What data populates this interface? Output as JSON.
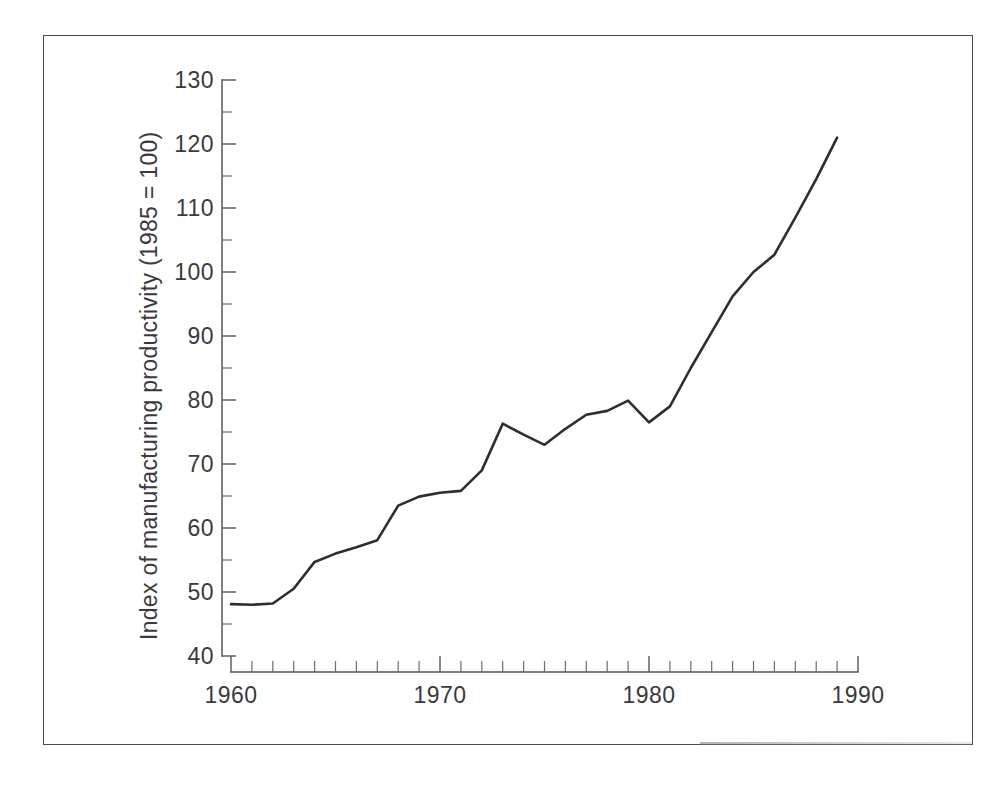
{
  "chart_data": {
    "type": "line",
    "title": "",
    "subtitle": "",
    "xlabel": "",
    "ylabel": "Index of manufacturing productivity (1985 = 100)",
    "ylim": [
      40,
      130
    ],
    "xlim": [
      1960,
      1990
    ],
    "y_ticks": [
      40,
      50,
      60,
      70,
      80,
      90,
      100,
      110,
      120,
      130
    ],
    "y_tick_labels": [
      "40",
      "50",
      "60",
      "70",
      "80",
      "90",
      "100",
      "110",
      "120",
      "130"
    ],
    "y_minor_tick_step": 5,
    "x_ticks": [
      1960,
      1970,
      1980,
      1990
    ],
    "x_tick_labels": [
      "1960",
      "1970",
      "1980",
      "1990"
    ],
    "x_minor_tick_step": 1,
    "grid": false,
    "legend": false,
    "legend_position": "none",
    "line_color": "#2e2e32",
    "x": [
      1960,
      1961,
      1962,
      1963,
      1964,
      1965,
      1966,
      1967,
      1968,
      1969,
      1970,
      1971,
      1972,
      1973,
      1974,
      1975,
      1976,
      1977,
      1978,
      1979,
      1980,
      1981,
      1982,
      1983,
      1984,
      1985,
      1986,
      1987,
      1988,
      1989
    ],
    "values": [
      48.1,
      48.0,
      48.2,
      50.5,
      54.7,
      56.0,
      57.0,
      58.1,
      63.5,
      64.9,
      65.5,
      65.8,
      69.0,
      76.3,
      74.6,
      73.0,
      75.5,
      77.7,
      78.3,
      79.9,
      76.5,
      79.0,
      85.0,
      90.6,
      96.2,
      100.0,
      102.7,
      108.5,
      114.5,
      121.0
    ],
    "series": [
      {
        "name": "Index of manufacturing productivity",
        "values": [
          48.1,
          48.0,
          48.2,
          50.5,
          54.7,
          56.0,
          57.0,
          58.1,
          63.5,
          64.9,
          65.5,
          65.8,
          69.0,
          76.3,
          74.6,
          73.0,
          75.5,
          77.7,
          78.3,
          79.9,
          76.5,
          79.0,
          85.0,
          90.6,
          96.2,
          100.0,
          102.7,
          108.5,
          114.5,
          121.0
        ]
      }
    ]
  }
}
